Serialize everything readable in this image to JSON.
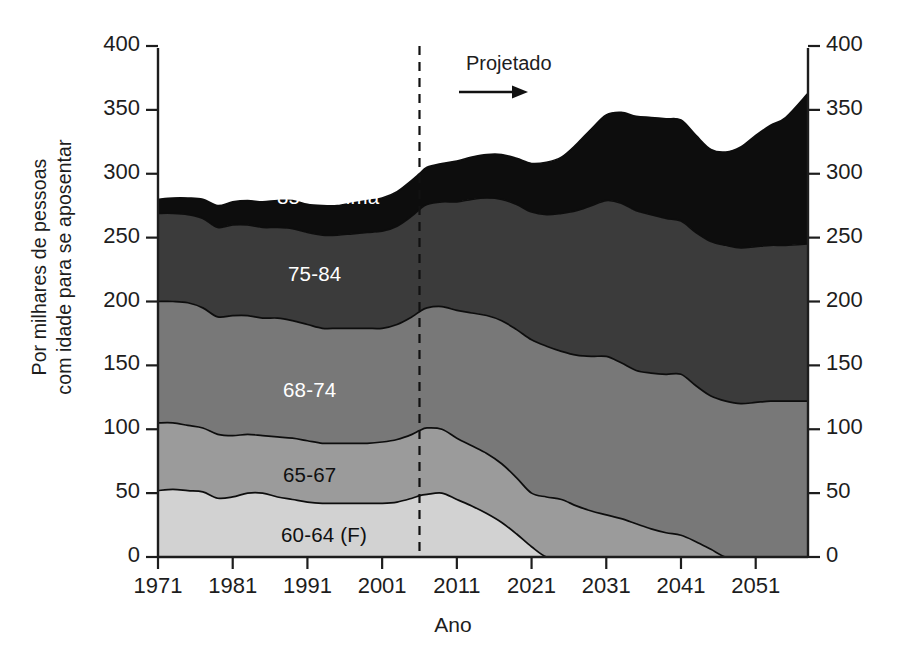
{
  "chart_data": {
    "type": "area",
    "stacked": true,
    "title": "",
    "xlabel": "Ano",
    "ylabel": "Por milhares de pessoas com idade para se aposentar",
    "ylabel_lines": [
      "Por milhares de pessoas",
      "com idade para se aposentar"
    ],
    "xlim": [
      1971,
      2058
    ],
    "ylim": [
      0,
      400
    ],
    "ytick_labels": [
      "0",
      "50",
      "100",
      "150",
      "200",
      "250",
      "300",
      "350",
      "400"
    ],
    "ytick_values": [
      0,
      50,
      100,
      150,
      200,
      250,
      300,
      350,
      400
    ],
    "xtick_labels": [
      "1971",
      "1981",
      "1991",
      "2001",
      "2011",
      "2021",
      "2031",
      "2041",
      "2051"
    ],
    "xtick_values": [
      1971,
      1981,
      1991,
      2001,
      2011,
      2021,
      2031,
      2041,
      2051
    ],
    "grid": false,
    "legend_position": "inline-bands",
    "annotations": [
      {
        "name": "projection-divider",
        "label": "Projetado",
        "x": 2006,
        "arrow": "right"
      }
    ],
    "x": [
      1971,
      1973,
      1975,
      1977,
      1979,
      1981,
      1983,
      1985,
      1987,
      1989,
      1991,
      1993,
      1995,
      1997,
      1999,
      2001,
      2003,
      2005,
      2006,
      2007,
      2009,
      2011,
      2013,
      2015,
      2017,
      2019,
      2021,
      2023,
      2025,
      2027,
      2029,
      2031,
      2033,
      2035,
      2037,
      2039,
      2041,
      2043,
      2045,
      2047,
      2049,
      2051,
      2053,
      2055,
      2058
    ],
    "series": [
      {
        "name": "60-64 (F)",
        "label": "60-64 (F)",
        "color": "#d2d2d2",
        "values": [
          52,
          53,
          52,
          51,
          46,
          47,
          50,
          50,
          47,
          45,
          43,
          42,
          42,
          42,
          42,
          42,
          43,
          46,
          48,
          49,
          50,
          45,
          40,
          34,
          27,
          18,
          8,
          0,
          0,
          0,
          0,
          0,
          0,
          0,
          0,
          0,
          0,
          0,
          0,
          0,
          0,
          0,
          0,
          0,
          0
        ]
      },
      {
        "name": "65-67",
        "label": "65-67",
        "color": "#9b9b9b",
        "values": [
          53,
          52,
          51,
          50,
          50,
          48,
          46,
          45,
          47,
          48,
          48,
          47,
          47,
          47,
          47,
          48,
          49,
          50,
          51,
          52,
          50,
          48,
          47,
          47,
          46,
          44,
          42,
          47,
          45,
          40,
          36,
          33,
          30,
          26,
          22,
          19,
          17,
          12,
          6,
          0,
          0,
          0,
          0,
          0,
          0
        ]
      },
      {
        "name": "68-74",
        "label": "68-74",
        "color": "#787878",
        "values": [
          95,
          95,
          96,
          94,
          92,
          94,
          93,
          92,
          93,
          92,
          91,
          90,
          90,
          90,
          90,
          89,
          90,
          92,
          93,
          94,
          96,
          100,
          104,
          108,
          112,
          116,
          120,
          118,
          116,
          118,
          121,
          124,
          122,
          120,
          122,
          124,
          126,
          122,
          120,
          122,
          120,
          121,
          122,
          122,
          122
        ]
      },
      {
        "name": "75-84",
        "label": "75-84",
        "color": "#3b3b3b",
        "values": [
          69,
          69,
          69,
          70,
          70,
          71,
          71,
          71,
          71,
          72,
          72,
          73,
          73,
          74,
          75,
          76,
          77,
          79,
          80,
          81,
          82,
          85,
          89,
          92,
          95,
          98,
          100,
          103,
          108,
          113,
          118,
          122,
          125,
          125,
          124,
          122,
          120,
          120,
          121,
          122,
          122,
          122,
          122,
          122,
          123
        ]
      },
      {
        "name": "85 e acima",
        "label": "85 e acima",
        "color": "#0d0d0d",
        "values": [
          11,
          12,
          13,
          15,
          17,
          18,
          19,
          20,
          21,
          22,
          22,
          23,
          23,
          24,
          25,
          26,
          27,
          28,
          28,
          29,
          30,
          32,
          33,
          34,
          35,
          36,
          38,
          41,
          44,
          52,
          60,
          67,
          71,
          74,
          76,
          78,
          79,
          76,
          72,
          73,
          79,
          87,
          94,
          100,
          118
        ]
      }
    ]
  },
  "axes": {
    "left_ticks": [
      "400",
      "350",
      "300",
      "250",
      "200",
      "150",
      "100",
      "50",
      "0"
    ],
    "right_ticks": [
      "400",
      "350",
      "300",
      "250",
      "200",
      "150",
      "100",
      "50",
      "0"
    ]
  }
}
